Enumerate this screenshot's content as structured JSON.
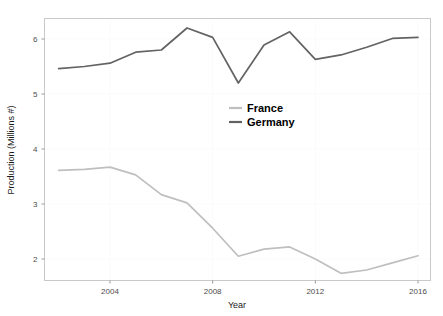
{
  "chart_data": {
    "type": "line",
    "title": "",
    "xlabel": "Year",
    "ylabel": "Production (Millions #)",
    "x": [
      2002,
      2003,
      2004,
      2005,
      2006,
      2007,
      2008,
      2009,
      2010,
      2011,
      2012,
      2013,
      2014,
      2015,
      2016
    ],
    "xlim": [
      2002,
      2016
    ],
    "ylim": [
      1.62,
      6.32
    ],
    "xticks": [
      2004,
      2008,
      2012,
      2016
    ],
    "xtick_labels": [
      "2004",
      "2008",
      "2012",
      "2016"
    ],
    "yticks": [
      2,
      3,
      4,
      5,
      6
    ],
    "ytick_labels": [
      "2",
      "3",
      "4",
      "5",
      "6"
    ],
    "grid": true,
    "legend_position": "center",
    "series": [
      {
        "name": "France",
        "color": "#bfbfbf",
        "values": [
          3.61,
          3.63,
          3.67,
          3.53,
          3.17,
          3.02,
          2.56,
          2.05,
          2.18,
          2.22,
          2.0,
          1.74,
          1.8,
          1.93,
          2.06
        ]
      },
      {
        "name": "Germany",
        "color": "#636363",
        "values": [
          5.46,
          5.5,
          5.56,
          5.76,
          5.8,
          6.2,
          6.03,
          5.2,
          5.89,
          6.13,
          5.63,
          5.71,
          5.85,
          6.01,
          6.03
        ]
      }
    ]
  },
  "legend": {
    "entries": [
      {
        "label": "France",
        "color": "#bfbfbf"
      },
      {
        "label": "Germany",
        "color": "#636363"
      }
    ]
  },
  "axes": {
    "x_title": "Year",
    "y_title": "Production (Millions #)"
  }
}
